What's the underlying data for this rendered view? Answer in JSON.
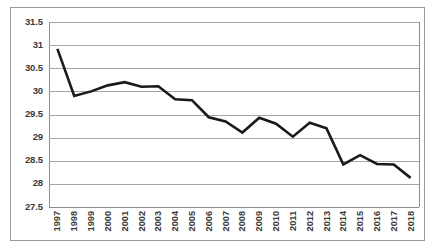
{
  "chart_data": {
    "type": "line",
    "title": "",
    "subtitle": "",
    "xlabel": "",
    "ylabel": "",
    "categories": [
      "1997",
      "1998",
      "1999",
      "2000",
      "2001",
      "2002",
      "2003",
      "2004",
      "2005",
      "2006",
      "2007",
      "2008",
      "2009",
      "2010",
      "2011",
      "2012",
      "2013",
      "2014",
      "2015",
      "2016",
      "2017",
      "2018"
    ],
    "values": [
      30.92,
      29.9,
      30.0,
      30.13,
      30.2,
      30.1,
      30.11,
      29.83,
      29.81,
      29.44,
      29.35,
      29.11,
      29.43,
      29.3,
      29.02,
      29.32,
      29.2,
      28.42,
      28.62,
      28.43,
      28.42,
      28.13
    ],
    "series": [
      {
        "name": "",
        "values": [
          30.92,
          29.9,
          30.0,
          30.13,
          30.2,
          30.1,
          30.11,
          29.83,
          29.81,
          29.44,
          29.35,
          29.11,
          29.43,
          29.3,
          29.02,
          29.32,
          29.2,
          28.42,
          28.62,
          28.43,
          28.42,
          28.13
        ]
      }
    ],
    "ylim": [
      27.5,
      31.5
    ],
    "ytick_step": 0.5,
    "ytick_labels": [
      "31.5",
      "31",
      "30.5",
      "30",
      "29.5",
      "29",
      "28.5",
      "28",
      "27.5"
    ],
    "ytick_values": [
      31.5,
      31,
      30.5,
      30,
      29.5,
      29,
      28.5,
      28,
      27.5
    ],
    "grid": true,
    "grid_axis": "y",
    "legend": false,
    "legend_position": "none",
    "annotations": [],
    "line_color": "#1a1a1a",
    "grid_color": "#a6a6a6",
    "border_color": "#9a9a9a",
    "background_color": "#ffffff",
    "line_width_px": 2.6,
    "markers": false
  },
  "labels": {
    "frame_name": "chart-border",
    "plot_name": "plot-area"
  },
  "icons": {}
}
